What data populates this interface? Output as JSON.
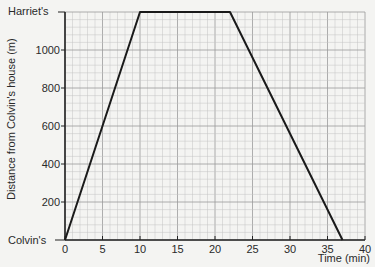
{
  "chart_data": {
    "type": "line",
    "title": "",
    "xlabel": "Time (min)",
    "ylabel": "Distance from Colvin's house (m)",
    "xlim": [
      0,
      40
    ],
    "ylim": [
      0,
      1200
    ],
    "x_ticks": [
      0,
      5,
      10,
      15,
      20,
      25,
      30,
      35,
      40
    ],
    "y_ticks": [
      200,
      400,
      600,
      800,
      1000
    ],
    "y_special_labels": [
      {
        "value": 0,
        "label": "Colvin's"
      },
      {
        "value": 1200,
        "label": "Harriet's"
      }
    ],
    "grid": true,
    "series": [
      {
        "name": "Journey",
        "x": [
          0,
          10,
          22,
          37
        ],
        "y": [
          0,
          1200,
          1200,
          0
        ]
      }
    ]
  },
  "labels": {
    "ylabel": "Distance from Colvin's house (m)",
    "xlabel": "Time (min)",
    "top": "Harriet's",
    "bottom": "Colvin's",
    "x_ticks": [
      "0",
      "5",
      "10",
      "15",
      "20",
      "25",
      "30",
      "35",
      "40"
    ],
    "y_ticks": [
      "200",
      "400",
      "600",
      "800",
      "1000"
    ]
  }
}
